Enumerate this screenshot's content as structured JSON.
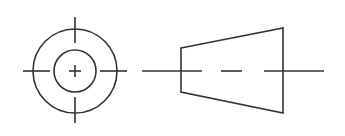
{
  "diagram": {
    "type": "orthographic-projection",
    "stroke_color": "#333333",
    "background": "#ffffff",
    "views": [
      {
        "name": "end-view",
        "center": [
          75,
          71
        ],
        "outer_radius": 42,
        "inner_radius": 21,
        "center_mark": "plus",
        "center_mark_half_size": 6,
        "centerline_ticks": {
          "top": [
            17,
            43
          ],
          "bottom": [
            97,
            123
          ],
          "left": [
            23,
            50
          ],
          "right": [
            100,
            127
          ]
        }
      },
      {
        "name": "side-view",
        "shape": "trapezoid",
        "points": [
          [
            181,
            48
          ],
          [
            283,
            28
          ],
          [
            283,
            113
          ],
          [
            181,
            92
          ]
        ],
        "centerline_y": 71,
        "centerline_segments": [
          [
            142,
            202
          ],
          [
            221,
            242
          ],
          [
            264,
            324
          ]
        ]
      }
    ]
  }
}
